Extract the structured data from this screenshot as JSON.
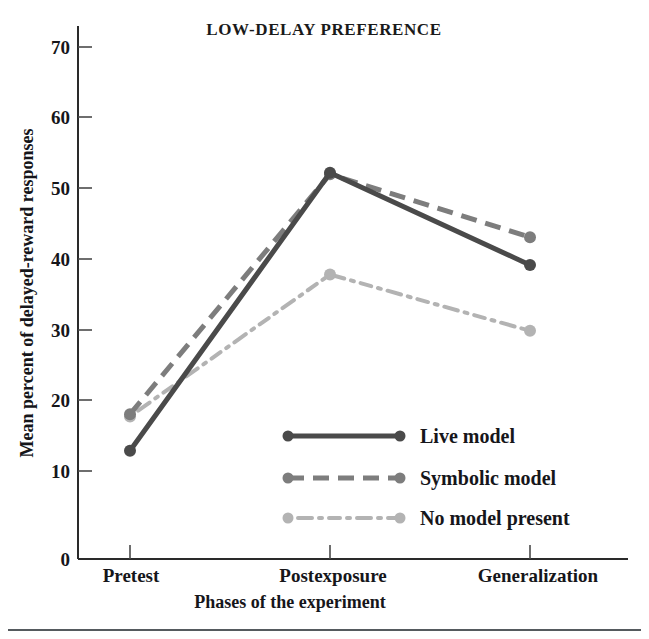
{
  "chart_data": {
    "type": "line",
    "title": "LOW-DELAY PREFERENCE",
    "xlabel": "Phases of the experiment",
    "ylabel": "Mean percent of delayed-reward responses",
    "categories": [
      "Pretest",
      "Postexposure",
      "Generalization"
    ],
    "ylim": [
      0,
      70
    ],
    "yticks": [
      0,
      10,
      20,
      30,
      40,
      50,
      60,
      70
    ],
    "ytick_labels": [
      "0",
      "10",
      "20",
      "30",
      "40",
      "50",
      "60",
      "70"
    ],
    "grid": false,
    "legend_position": "inside-lower-center",
    "series": [
      {
        "name": "Live model",
        "values": [
          14.8,
          52.8,
          40.2
        ],
        "color": "#4a4a4a",
        "style": "solid"
      },
      {
        "name": "Symbolic model",
        "values": [
          19.8,
          52.6,
          44.0
        ],
        "color": "#7d7d7d",
        "style": "dashed"
      },
      {
        "name": "No model present",
        "values": [
          19.5,
          38.9,
          31.2
        ],
        "color": "#b3b3b3",
        "style": "dash-dot"
      }
    ]
  },
  "colors": {
    "live_model": "#4a4a4a",
    "symbolic_model": "#7d7d7d",
    "no_model": "#b3b3b3",
    "axis": "#2a2a2a",
    "text": "#16161a",
    "footer_rule": "#555a5e",
    "background": "#ffffff"
  },
  "legend": {
    "items": [
      {
        "label": "Live model"
      },
      {
        "label": "Symbolic model"
      },
      {
        "label": "No model present"
      }
    ]
  },
  "axes": {
    "y_tick_0": "0",
    "y_tick_10": "10",
    "y_tick_20": "20",
    "y_tick_30": "30",
    "y_tick_40": "40",
    "y_tick_50": "50",
    "y_tick_60": "60",
    "y_tick_70": "70",
    "x_cat_0": "Pretest",
    "x_cat_1": "Postexposure",
    "x_cat_2": "Generalization"
  }
}
